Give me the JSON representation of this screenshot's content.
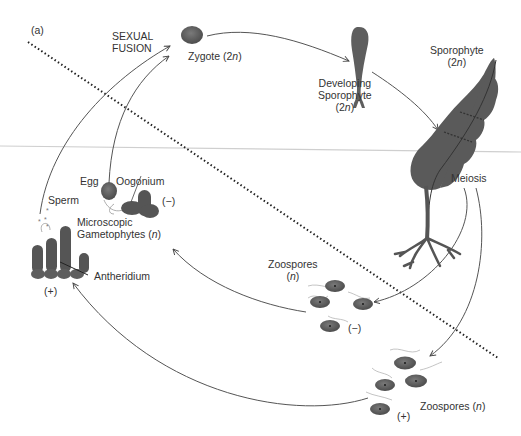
{
  "panel_label": "(a)",
  "labels": {
    "sexual_fusion_1": "SEXUAL",
    "sexual_fusion_2": "FUSION",
    "zygote": "Zygote (2",
    "zygote_n": "n",
    "zygote_close": ")",
    "developing_1": "Developing",
    "developing_2": "Sporophyte",
    "developing_3": "(2",
    "developing_3n": "n",
    "developing_3c": ")",
    "sporophyte_1": "Sporophyte",
    "sporophyte_2": "(2",
    "sporophyte_2n": "n",
    "sporophyte_2c": ")",
    "meiosis": "Meiosis",
    "egg": "Egg",
    "oogonium": "Oogonium",
    "minus_female": "(−)",
    "sperm": "Sperm",
    "microscopic_1": "Microscopic",
    "microscopic_2": "Gametophytes (",
    "microscopic_2n": "n",
    "microscopic_2c": ")",
    "antheridium": "Antheridium",
    "plus_male": "(+)",
    "zoospores_minus_1": "Zoospores",
    "zoospores_minus_2": "(",
    "zoospores_minus_2n": "n",
    "zoospores_minus_2c": ")",
    "minus_zoospores": "(−)",
    "zoospores_plus": "Zoospores (",
    "zoospores_plus_n": "n",
    "zoospores_plus_c": ")",
    "plus_zoospores": "(+)"
  },
  "colors": {
    "organism_fill": "#5f5f5f",
    "organism_dark": "#3f3f3f",
    "arrow": "#555555",
    "dotted_line": "#222222",
    "horizon_line": "#c8c8c8",
    "text": "#333333"
  }
}
